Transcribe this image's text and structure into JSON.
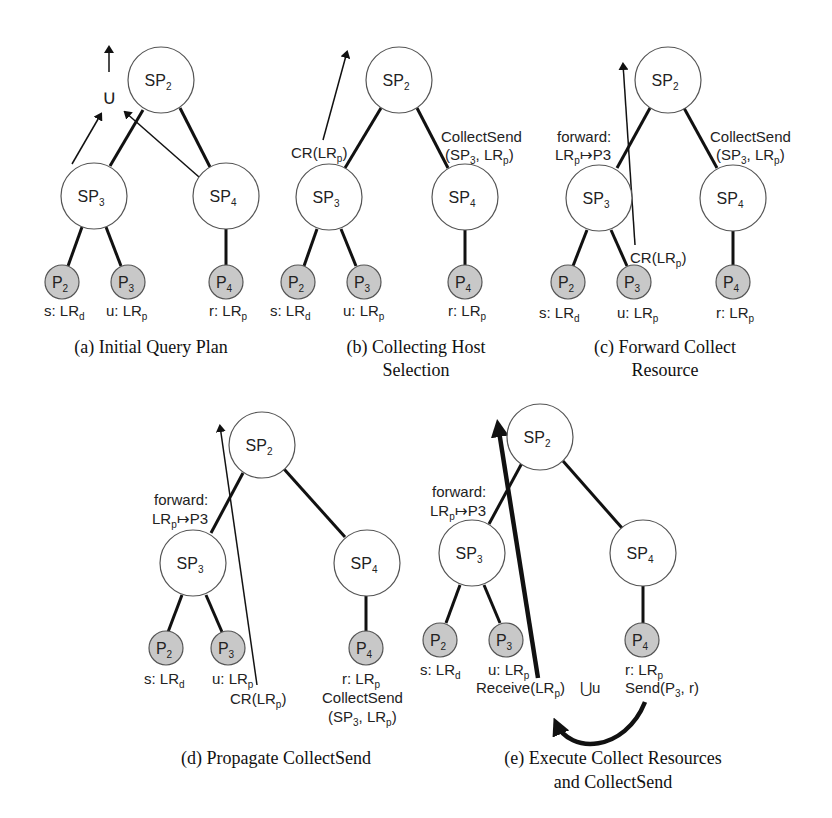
{
  "panels": [
    {
      "id": "a",
      "caption": [
        "(a) Initial Query Plan"
      ],
      "nodes": {
        "SP2": "SP",
        "SP3": "SP",
        "SP4": "SP",
        "P2": "P",
        "P3": "P",
        "P4": "P"
      },
      "leaf_labels": [
        "s: LR_d",
        "u: LR_p",
        "r: LR_p"
      ],
      "annotations": [
        "∪"
      ]
    },
    {
      "id": "b",
      "caption": [
        "(b) Collecting Host",
        "Selection"
      ],
      "leaf_labels": [
        "s: LR_d",
        "u: LR_p",
        "r: LR_p"
      ],
      "annotations": [
        "CR(LR_p)",
        "CollectSend",
        "(SP_3, LR_p)"
      ]
    },
    {
      "id": "c",
      "caption": [
        "(c) Forward Collect",
        "Resource"
      ],
      "leaf_labels": [
        "s: LR_d",
        "u: LR_p",
        "r: LR_p"
      ],
      "annotations": [
        "forward:",
        "LR_p↦P3",
        "CollectSend",
        "(SP_3, LR_p)",
        "CR(LR_p)"
      ]
    },
    {
      "id": "d",
      "caption": [
        "(d) Propagate CollectSend"
      ],
      "leaf_labels": [
        "s: LR_d",
        "u: LR_p",
        "r: LR_p"
      ],
      "annotations": [
        "forward:",
        "LR_p↦P3",
        "CR(LR_p)",
        "CollectSend",
        "(SP_3, LR_p)"
      ]
    },
    {
      "id": "e",
      "caption": [
        "(e) Execute Collect Resources",
        "and CollectSend"
      ],
      "leaf_labels": [
        "s: LR_d",
        "u: LR_p",
        "r: LR_p"
      ],
      "annotations": [
        "forward:",
        "LR_p↦P3",
        "Receive(LR_p)",
        "∪u",
        "Send(P_3, r)"
      ]
    }
  ],
  "text": {
    "sp": "SP",
    "p": "P",
    "n2": "2",
    "n3": "3",
    "n4": "4",
    "union": "∪",
    "union_u": "⋃u",
    "s_lr": "s: LR",
    "u_lr": "u: LR",
    "r_lr": "r: LR",
    "sub_d": "d",
    "sub_p": "p",
    "cr": "CR(LR",
    "close": ")",
    "collectsend": "CollectSend",
    "cs_args_open": "(SP",
    "cs_args_mid": ", LR",
    "forward": "forward:",
    "lr": "LR",
    "maps_p3": "↦P3",
    "receive": "Receive(LR",
    "send_open": "Send(P",
    "send_close": ", r)",
    "cap_a": "(a) Initial Query Plan",
    "cap_b1": "(b) Collecting Host",
    "cap_b2": "Selection",
    "cap_c1": "(c) Forward Collect",
    "cap_c2": "Resource",
    "cap_d": "(d) Propagate CollectSend",
    "cap_e1": "(e) Execute Collect Resources",
    "cap_e2": "and CollectSend"
  }
}
